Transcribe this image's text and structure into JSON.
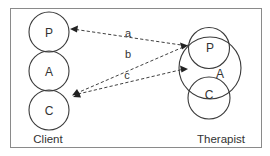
{
  "diagram": {
    "type": "transactional-analysis",
    "frame": {
      "x": 10,
      "y": 8,
      "width": 252,
      "height": 140
    },
    "client": {
      "caption": "Client",
      "states": [
        {
          "label": "P",
          "cx": 49,
          "cy": 32,
          "r": 20
        },
        {
          "label": "A",
          "cx": 49,
          "cy": 71,
          "r": 20
        },
        {
          "label": "C",
          "cx": 49,
          "cy": 110,
          "r": 20
        }
      ]
    },
    "therapist": {
      "caption": "Therapist",
      "states": [
        {
          "label": "P",
          "cx": 209,
          "cy": 48,
          "r": 20
        },
        {
          "label": "A",
          "cx": 210,
          "cy": 68,
          "r": 31
        },
        {
          "label": "C",
          "cx": 209,
          "cy": 98,
          "r": 21
        }
      ]
    },
    "transactions": [
      {
        "label": "a",
        "from": "therapist.P",
        "to": "client.P"
      },
      {
        "label": "b",
        "from": "therapist.P",
        "to": "client.C"
      },
      {
        "label": "c",
        "from": "client.C",
        "to": "therapist.A"
      }
    ],
    "colors": {
      "stroke": "#3a3a3a",
      "frame": "#8a8a8a",
      "text": "#333333"
    }
  }
}
